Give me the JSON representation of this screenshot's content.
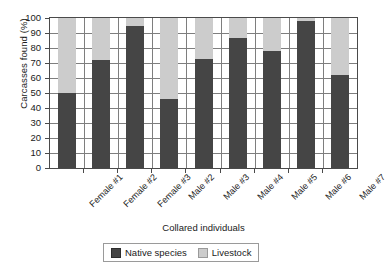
{
  "chart_data": {
    "type": "bar",
    "title": "",
    "subtitle": "",
    "xlabel": "Collared individuals",
    "ylabel": "Carcasses found (%)",
    "categories": [
      "Female #1",
      "Female #2",
      "Female #3",
      "Male #2",
      "Male #3",
      "Male #4",
      "Male #5",
      "Male #6",
      "Male #7"
    ],
    "series": [
      {
        "name": "Native species",
        "color": "#454545",
        "values": [
          50,
          72,
          95,
          46,
          73,
          87,
          78,
          98,
          62
        ]
      },
      {
        "name": "Livestock",
        "color": "#cccccc",
        "values": [
          50,
          28,
          5,
          54,
          27,
          13,
          22,
          2,
          38
        ]
      }
    ],
    "stacked": true,
    "ylim": [
      0,
      100
    ],
    "yticks": [
      0,
      10,
      20,
      30,
      40,
      50,
      60,
      70,
      80,
      90,
      100
    ],
    "ytick_labels": [
      "0",
      "10",
      "20",
      "30",
      "40",
      "50",
      "60",
      "70",
      "80",
      "90",
      "100"
    ],
    "grid": "horizontal-and-vertical",
    "legend_position": "bottom-center"
  },
  "legend": {
    "entries": [
      {
        "label": "Native species",
        "swatch": "dark-swatch-icon"
      },
      {
        "label": "Livestock",
        "swatch": "light-swatch-icon"
      }
    ]
  }
}
